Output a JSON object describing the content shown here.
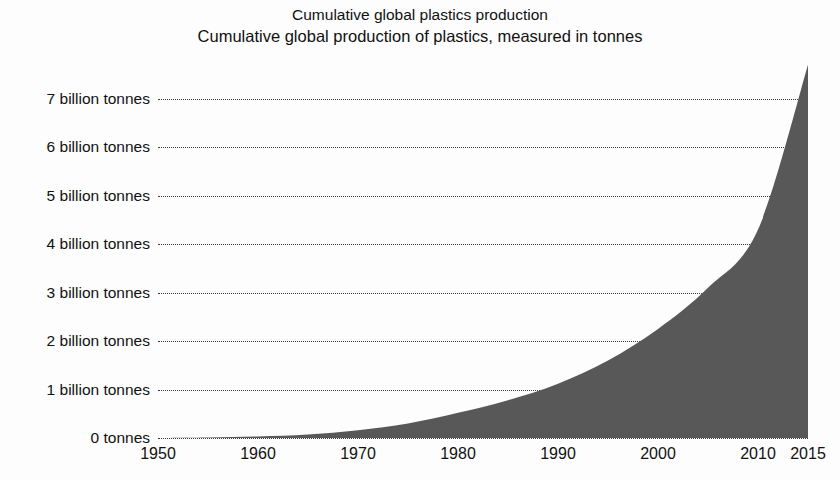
{
  "chart_data": {
    "type": "area",
    "title": "Cumulative global plastics production",
    "subtitle": "Cumulative global production of plastics, measured in tonnes",
    "xlabel": "",
    "ylabel": "",
    "grid": "horizontal-dotted",
    "legend": "none",
    "fill_color": "#585858",
    "grid_color": "#3a3a3a",
    "background_color": "#fdfdfd",
    "xlim": [
      1950,
      2015
    ],
    "ylim": [
      0,
      7700000000
    ],
    "y_unit": "tonnes",
    "y_tick_labels": [
      "7 billion tonnes",
      "6 billion tonnes",
      "5 billion tonnes",
      "4 billion tonnes",
      "3 billion tonnes",
      "2 billion tonnes",
      "1 billion tonnes",
      "0 tonnes"
    ],
    "y_tick_values": [
      7,
      6,
      5,
      4,
      3,
      2,
      1,
      0
    ],
    "x_tick_labels": [
      "1950",
      "1960",
      "1970",
      "1980",
      "1990",
      "2000",
      "2010",
      "2015"
    ],
    "x_tick_values": [
      1950,
      1960,
      1970,
      1980,
      1990,
      2000,
      2010,
      2015
    ],
    "series": [
      {
        "name": "Cumulative global plastics production",
        "unit": "billion tonnes",
        "x": [
          1950,
          1955,
          1960,
          1965,
          1970,
          1975,
          1980,
          1985,
          1990,
          1995,
          2000,
          2005,
          2010,
          2015
        ],
        "values": [
          0.0,
          0.01,
          0.03,
          0.07,
          0.16,
          0.3,
          0.52,
          0.78,
          1.12,
          1.6,
          2.25,
          3.1,
          4.3,
          7.7
        ]
      }
    ]
  }
}
